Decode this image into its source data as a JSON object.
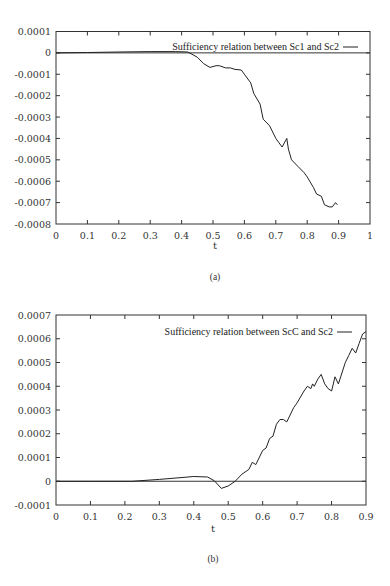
{
  "chart_data": [
    {
      "id": "a",
      "type": "line",
      "caption": "(a)",
      "title": "",
      "xlabel": "t",
      "ylabel": "",
      "xlim": [
        0,
        1
      ],
      "ylim": [
        -0.0008,
        0.0001
      ],
      "xticks": [
        0,
        0.1,
        0.2,
        0.3,
        0.4,
        0.5,
        0.6,
        0.7,
        0.8,
        0.9,
        1
      ],
      "xtick_labels": [
        "0",
        "0.1",
        "0.2",
        "0.3",
        "0.4",
        "0.5",
        "0.6",
        "0.7",
        "0.8",
        "0.9",
        "1"
      ],
      "yticks": [
        0.0001,
        0,
        -0.0001,
        -0.0002,
        -0.0003,
        -0.0004,
        -0.0005,
        -0.0006,
        -0.0007,
        -0.0008
      ],
      "ytick_labels": [
        "0.0001",
        "0",
        "-0.0001",
        "-0.0002",
        "-0.0003",
        "-0.0004",
        "-0.0005",
        "-0.0006",
        "-0.0007",
        "-0.0008"
      ],
      "grid": false,
      "zero_line": true,
      "legend_position": "upper right",
      "series": [
        {
          "name": "Sufficiency relation between Sc1 and Sc2",
          "x": [
            0,
            0.1,
            0.2,
            0.3,
            0.38,
            0.42,
            0.45,
            0.47,
            0.49,
            0.51,
            0.52,
            0.54,
            0.555,
            0.57,
            0.59,
            0.6,
            0.62,
            0.63,
            0.65,
            0.66,
            0.68,
            0.7,
            0.71,
            0.72,
            0.735,
            0.74,
            0.75,
            0.77,
            0.79,
            0.8,
            0.82,
            0.83,
            0.845,
            0.855,
            0.87,
            0.88,
            0.89,
            0.896
          ],
          "y": [
            0,
            2e-06,
            4e-06,
            6e-06,
            6e-06,
            4e-06,
            -2e-05,
            -5e-05,
            -6.8e-05,
            -6e-05,
            -6e-05,
            -7e-05,
            -7e-05,
            -7.7e-05,
            -8e-05,
            -0.0001,
            -0.00014,
            -0.00019,
            -0.00024,
            -0.00031,
            -0.00034,
            -0.0004,
            -0.00042,
            -0.00044,
            -0.0004,
            -0.00045,
            -0.0005,
            -0.00053,
            -0.00056,
            -0.00058,
            -0.00063,
            -0.00066,
            -0.00067,
            -0.00071,
            -0.00072,
            -0.00072,
            -0.0007,
            -0.00071
          ]
        }
      ]
    },
    {
      "id": "b",
      "type": "line",
      "caption": "(b)",
      "title": "",
      "xlabel": "t",
      "ylabel": "",
      "xlim": [
        0,
        0.9
      ],
      "ylim": [
        -0.0001,
        0.0007
      ],
      "xticks": [
        0,
        0.1,
        0.2,
        0.3,
        0.4,
        0.5,
        0.6,
        0.7,
        0.8,
        0.9
      ],
      "xtick_labels": [
        "0",
        "0.1",
        "0.2",
        "0.3",
        "0.4",
        "0.5",
        "0.6",
        "0.7",
        "0.8",
        "0.9"
      ],
      "yticks": [
        0.0007,
        0.0006,
        0.0005,
        0.0004,
        0.0003,
        0.0002,
        0.0001,
        0,
        -0.0001
      ],
      "ytick_labels": [
        "0.0007",
        "0.0006",
        "0.0005",
        "0.0004",
        "0.0003",
        "0.0002",
        "0.0001",
        "0",
        "-0.0001"
      ],
      "grid": false,
      "zero_line": true,
      "legend_position": "upper right",
      "series": [
        {
          "name": "Sufficiency relation between ScC and Sc2",
          "x": [
            0,
            0.1,
            0.22,
            0.3,
            0.36,
            0.4,
            0.44,
            0.46,
            0.48,
            0.5,
            0.52,
            0.54,
            0.56,
            0.57,
            0.58,
            0.6,
            0.61,
            0.62,
            0.63,
            0.64,
            0.65,
            0.66,
            0.67,
            0.69,
            0.7,
            0.72,
            0.73,
            0.74,
            0.745,
            0.75,
            0.76,
            0.77,
            0.78,
            0.79,
            0.8,
            0.81,
            0.82,
            0.84,
            0.85,
            0.86,
            0.87,
            0.88,
            0.89,
            0.9
          ],
          "y": [
            0,
            0,
            0,
            8e-06,
            1.5e-05,
            2e-05,
            1.8e-05,
            2e-06,
            -3e-05,
            -2e-05,
            0,
            3e-05,
            5e-05,
            8e-05,
            7e-05,
            0.00013,
            0.00014,
            0.00018,
            0.00019,
            0.00024,
            0.00026,
            0.00026,
            0.00025,
            0.00031,
            0.00033,
            0.00038,
            0.0004,
            0.00039,
            0.00041,
            0.0004,
            0.00043,
            0.00045,
            0.00041,
            0.00039,
            0.00038,
            0.00044,
            0.00041,
            0.0005,
            0.00053,
            0.00056,
            0.00054,
            0.00058,
            0.00062,
            0.00063
          ]
        }
      ]
    }
  ]
}
